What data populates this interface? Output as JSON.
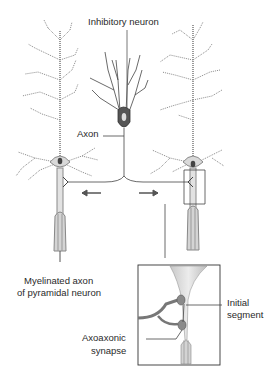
{
  "diagram": {
    "labels": {
      "inhibitory_neuron": "Inhibitory neuron",
      "axon": "Axon",
      "myelinated_axon_line1": "Myelinated axon",
      "myelinated_axon_line2": "of pyramidal neuron",
      "initial_segment_line1": "Initial",
      "initial_segment_line2": "segment",
      "axoaxonic_line1": "Axoaxonic",
      "axoaxonic_line2": "synapse"
    },
    "colors": {
      "line": "#3a3a3a",
      "neuron_fill": "#d9d9d9",
      "soma_dark": "#555555",
      "inset_fill": "#cfcfcf"
    }
  }
}
